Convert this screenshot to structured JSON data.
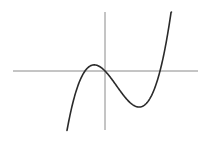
{
  "chart_data": {
    "type": "line",
    "title": "",
    "xlabel": "",
    "ylabel": "",
    "grid": false,
    "legend": null,
    "function": {
      "form": "f(x) = k * x * (x + a) * (x - b)",
      "roots_relative": [
        -20,
        0,
        55
      ],
      "local_max_relative": {
        "x": -12,
        "y": 6
      },
      "local_min_relative": {
        "x": 35,
        "y": -36
      },
      "k": 0.000935,
      "a": 20,
      "b": 55
    },
    "x_range_relative": [
      -38,
      67
    ],
    "series": [
      {
        "name": "f(x)",
        "color": "#2a2a2a"
      }
    ],
    "axes": {
      "color": "#8a8a8a",
      "origin_px": {
        "x": 105,
        "y": 71
      },
      "x_axis_px": {
        "x1": 13,
        "x2": 198
      },
      "y_axis_px": {
        "y1": 12,
        "y2": 130
      }
    },
    "clip_top_px": 12
  }
}
